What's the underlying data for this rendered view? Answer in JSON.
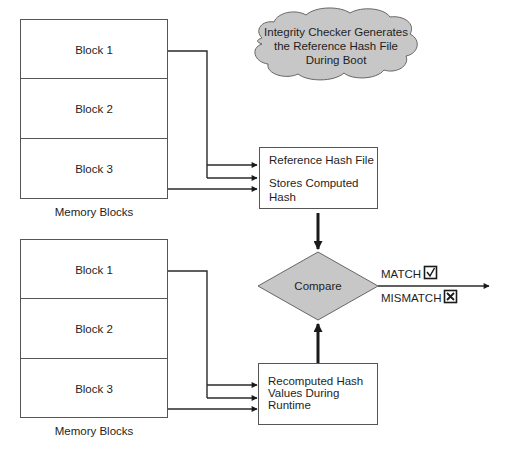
{
  "top_memory": {
    "blocks": [
      {
        "label": "Block 1"
      },
      {
        "label": "Block 2"
      },
      {
        "label": "Block 3"
      }
    ],
    "caption": "Memory Blocks"
  },
  "bottom_memory": {
    "blocks": [
      {
        "label": "Block 1"
      },
      {
        "label": "Block 2"
      },
      {
        "label": "Block 3"
      }
    ],
    "caption": "Memory Blocks"
  },
  "cloud": {
    "lines": [
      "Integrity Checker Generates",
      "the Reference Hash File",
      "During Boot"
    ]
  },
  "reference_box": {
    "title": "Reference Hash File",
    "lines": [
      "Stores Computed",
      "Hash"
    ]
  },
  "recomputed_box": {
    "lines": [
      "Recomputed Hash",
      "Values During",
      "Runtime"
    ]
  },
  "compare": {
    "label": "Compare"
  },
  "outcomes": {
    "match": {
      "label": "MATCH",
      "icon": "checkbox-checked-icon"
    },
    "mismatch": {
      "label": "MISMATCH",
      "icon": "checkbox-x-icon"
    }
  },
  "colors": {
    "shape_fill": "#c7c7c7",
    "stroke": "#1a1a1a",
    "background": "#ffffff"
  }
}
